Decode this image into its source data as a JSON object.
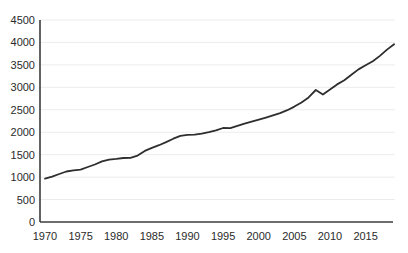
{
  "chart_data": {
    "type": "line",
    "title": "",
    "xlabel": "",
    "ylabel": "",
    "legend": "none",
    "grid": "horizontal",
    "x": [
      1970,
      1971,
      1972,
      1973,
      1974,
      1975,
      1976,
      1977,
      1978,
      1979,
      1980,
      1981,
      1982,
      1983,
      1984,
      1985,
      1986,
      1987,
      1988,
      1989,
      1990,
      1991,
      1992,
      1993,
      1994,
      1995,
      1996,
      1997,
      1998,
      1999,
      2000,
      2001,
      2002,
      2003,
      2004,
      2005,
      2006,
      2007,
      2008,
      2009,
      2010,
      2011,
      2012,
      2013,
      2014,
      2015,
      2016,
      2017,
      2018,
      2019
    ],
    "values": [
      965,
      1010,
      1070,
      1125,
      1150,
      1165,
      1225,
      1280,
      1350,
      1390,
      1405,
      1425,
      1430,
      1480,
      1585,
      1650,
      1710,
      1780,
      1855,
      1920,
      1940,
      1945,
      1970,
      2000,
      2040,
      2095,
      2090,
      2140,
      2190,
      2235,
      2280,
      2325,
      2375,
      2425,
      2490,
      2570,
      2665,
      2775,
      2940,
      2840,
      2950,
      3065,
      3160,
      3280,
      3400,
      3490,
      3580,
      3700,
      3840,
      3960
    ],
    "xlim": [
      1970,
      2019
    ],
    "ylim": [
      0,
      4500
    ],
    "x_ticks": [
      1970,
      1975,
      1980,
      1985,
      1990,
      1995,
      2000,
      2005,
      2010,
      2015
    ],
    "y_ticks": [
      0,
      500,
      1000,
      1500,
      2000,
      2500,
      3000,
      3500,
      4000,
      4500
    ],
    "colors": {
      "line": "#2e2e2e",
      "axis": "#3c3c3c",
      "grid": "#ececec",
      "tick_label": "#262626",
      "background": "#ffffff"
    }
  }
}
